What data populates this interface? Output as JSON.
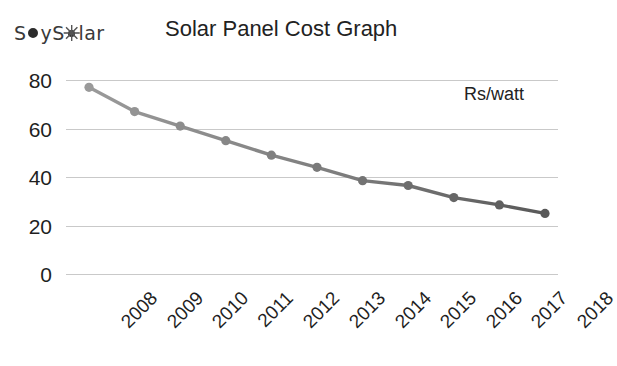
{
  "brand": {
    "name_part1": "S",
    "name_part2": "y ",
    "name_part3": "S",
    "name_part4": "lar",
    "full_name": "Soy Solar",
    "dot_icon_name": "dot-icon",
    "sun_icon_name": "sun-icon"
  },
  "header": {
    "title": "Solar Panel Cost Graph"
  },
  "annotation": {
    "unit_label": "Rs/watt"
  },
  "colors": {
    "line_light": "#9a9a9a",
    "line_dark": "#595959",
    "gridline": "#c9c9c9",
    "text": "#1f1f1f",
    "background": "#ffffff"
  },
  "chart_data": {
    "type": "line",
    "title": "Solar Panel Cost Graph",
    "xlabel": "",
    "ylabel": "Rs/watt",
    "annotations": [
      "Rs/watt"
    ],
    "grid": true,
    "legend": "none",
    "ylim": [
      0,
      80
    ],
    "yticks": [
      0,
      20,
      40,
      60,
      80
    ],
    "categories": [
      "2008",
      "2009",
      "2010",
      "2011",
      "2012",
      "2013",
      "2014",
      "2015",
      "2016",
      "2017",
      "2018"
    ],
    "x": [
      2008,
      2009,
      2010,
      2011,
      2012,
      2013,
      2014,
      2015,
      2016,
      2017,
      2018
    ],
    "values": [
      77,
      67,
      61,
      55,
      49,
      44,
      38.5,
      36.5,
      31.5,
      28.5,
      25
    ],
    "series": [
      {
        "name": "Solar panel cost",
        "unit": "Rs/watt",
        "values": [
          77,
          67,
          61,
          55,
          49,
          44,
          38.5,
          36.5,
          31.5,
          28.5,
          25
        ]
      }
    ]
  }
}
